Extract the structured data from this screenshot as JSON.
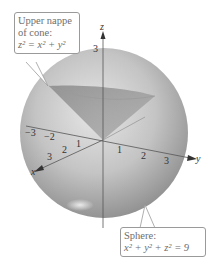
{
  "figure": {
    "cone_callout": {
      "title": "Upper nappe",
      "title2": "of cone:",
      "equation": "z² = x² + y²"
    },
    "sphere_callout": {
      "title": "Sphere:",
      "equation": "x² + y² + z² = 9"
    },
    "axes": {
      "x_label": "x",
      "y_label": "y",
      "z_label": "z",
      "x_ticks": [
        "1",
        "2",
        "3"
      ],
      "y_ticks": [
        "1",
        "2",
        "3"
      ],
      "neg_y_ticks": [
        "−2",
        "−3"
      ],
      "z_tick": "3"
    }
  }
}
